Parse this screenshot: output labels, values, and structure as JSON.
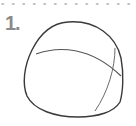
{
  "step": {
    "number": "1."
  },
  "colors": {
    "stroke": "#3a3a3a",
    "guide": "#6a6a6a",
    "dots": "#b0b0b0",
    "number": "#8a8a8a"
  },
  "illustration": {
    "subject": "head-construction-sphere-sketch"
  }
}
